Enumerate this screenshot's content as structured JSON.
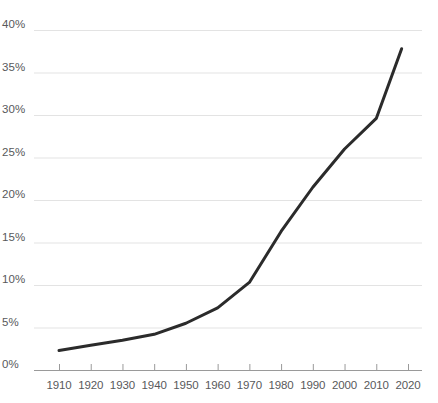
{
  "chart_data": {
    "type": "line",
    "title": "",
    "subtitle": "",
    "xlabel": "",
    "ylabel": "",
    "xlim": [
      1906,
      2022
    ],
    "ylim": [
      0,
      40
    ],
    "grid": true,
    "legend": false,
    "legend_position": "none",
    "y_ticks": [
      "0%",
      "5%",
      "10%",
      "15%",
      "20%",
      "25%",
      "30%",
      "35%",
      "40%"
    ],
    "y_tick_values": [
      0,
      5,
      10,
      15,
      20,
      25,
      30,
      35,
      40
    ],
    "x_ticks": [
      "1910",
      "1920",
      "1930",
      "1940",
      "1950",
      "1960",
      "1970",
      "1980",
      "1990",
      "2000",
      "2010",
      "2020"
    ],
    "x_tick_values": [
      1910,
      1920,
      1930,
      1940,
      1950,
      1960,
      1970,
      1980,
      1990,
      2000,
      2010,
      2020
    ],
    "series": [
      {
        "name": "",
        "color": "#2b2b2b",
        "x": [
          1910,
          1920,
          1930,
          1940,
          1950,
          1960,
          1970,
          1980,
          1990,
          2000,
          2010,
          2018
        ],
        "values": [
          2.3,
          2.9,
          3.5,
          4.2,
          5.5,
          7.3,
          10.3,
          16.3,
          21.5,
          26.0,
          29.6,
          37.8
        ]
      }
    ],
    "colors": {
      "line": "#2b2b2b",
      "grid": "#e3e3e3",
      "axis": "#9a9a9a",
      "tick_text": "#58595b",
      "background": "#ffffff"
    }
  }
}
